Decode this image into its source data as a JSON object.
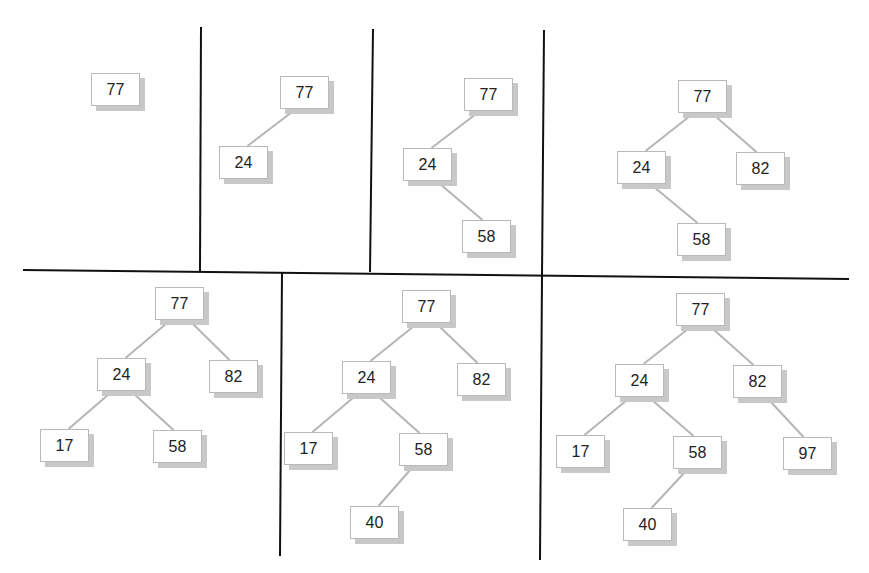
{
  "colors": {
    "divider": "#111111",
    "edge": "#b5b5b5",
    "node_border": "#b9b9b9",
    "node_shadow": "#c8c8c8",
    "text": "#222222"
  },
  "dividers": [
    {
      "x1": 201,
      "y1": 27,
      "x2": 200,
      "y2": 271
    },
    {
      "x1": 373,
      "y1": 29,
      "x2": 370,
      "y2": 272
    },
    {
      "x1": 544,
      "y1": 30,
      "x2": 542,
      "y2": 276
    },
    {
      "x1": 23,
      "y1": 270,
      "x2": 849,
      "y2": 279
    },
    {
      "x1": 282,
      "y1": 273,
      "x2": 280,
      "y2": 556
    },
    {
      "x1": 542,
      "y1": 276,
      "x2": 540,
      "y2": 560
    }
  ],
  "panels": [
    {
      "step": 1,
      "nodes": [
        {
          "id": "a",
          "value": "77",
          "x": 91,
          "y": 73
        }
      ],
      "edges": []
    },
    {
      "step": 2,
      "nodes": [
        {
          "id": "a",
          "value": "77",
          "x": 280,
          "y": 76
        },
        {
          "id": "b",
          "value": "24",
          "x": 219,
          "y": 146
        }
      ],
      "edges": [
        [
          "a",
          "b"
        ]
      ]
    },
    {
      "step": 3,
      "nodes": [
        {
          "id": "a",
          "value": "77",
          "x": 464,
          "y": 78
        },
        {
          "id": "b",
          "value": "24",
          "x": 403,
          "y": 148
        },
        {
          "id": "c",
          "value": "58",
          "x": 462,
          "y": 220
        }
      ],
      "edges": [
        [
          "a",
          "b"
        ],
        [
          "b",
          "c"
        ]
      ]
    },
    {
      "step": 4,
      "nodes": [
        {
          "id": "a",
          "value": "77",
          "x": 678,
          "y": 80
        },
        {
          "id": "b",
          "value": "24",
          "x": 617,
          "y": 151
        },
        {
          "id": "d",
          "value": "82",
          "x": 736,
          "y": 152
        },
        {
          "id": "c",
          "value": "58",
          "x": 677,
          "y": 223
        }
      ],
      "edges": [
        [
          "a",
          "b"
        ],
        [
          "a",
          "d"
        ],
        [
          "b",
          "c"
        ]
      ]
    },
    {
      "step": 5,
      "nodes": [
        {
          "id": "a",
          "value": "77",
          "x": 155,
          "y": 287
        },
        {
          "id": "b",
          "value": "24",
          "x": 97,
          "y": 358
        },
        {
          "id": "d",
          "value": "82",
          "x": 209,
          "y": 360
        },
        {
          "id": "e",
          "value": "17",
          "x": 40,
          "y": 429
        },
        {
          "id": "c",
          "value": "58",
          "x": 153,
          "y": 430
        }
      ],
      "edges": [
        [
          "a",
          "b"
        ],
        [
          "a",
          "d"
        ],
        [
          "b",
          "e"
        ],
        [
          "b",
          "c"
        ]
      ]
    },
    {
      "step": 6,
      "nodes": [
        {
          "id": "a",
          "value": "77",
          "x": 402,
          "y": 290
        },
        {
          "id": "b",
          "value": "24",
          "x": 342,
          "y": 361
        },
        {
          "id": "d",
          "value": "82",
          "x": 457,
          "y": 363
        },
        {
          "id": "e",
          "value": "17",
          "x": 284,
          "y": 432
        },
        {
          "id": "c",
          "value": "58",
          "x": 399,
          "y": 433
        },
        {
          "id": "f",
          "value": "40",
          "x": 350,
          "y": 506
        }
      ],
      "edges": [
        [
          "a",
          "b"
        ],
        [
          "a",
          "d"
        ],
        [
          "b",
          "e"
        ],
        [
          "b",
          "c"
        ],
        [
          "c",
          "f"
        ]
      ]
    },
    {
      "step": 7,
      "nodes": [
        {
          "id": "a",
          "value": "77",
          "x": 676,
          "y": 293
        },
        {
          "id": "b",
          "value": "24",
          "x": 615,
          "y": 364
        },
        {
          "id": "d",
          "value": "82",
          "x": 733,
          "y": 365
        },
        {
          "id": "e",
          "value": "17",
          "x": 556,
          "y": 435
        },
        {
          "id": "c",
          "value": "58",
          "x": 673,
          "y": 436
        },
        {
          "id": "g",
          "value": "97",
          "x": 783,
          "y": 437
        },
        {
          "id": "f",
          "value": "40",
          "x": 623,
          "y": 508
        }
      ],
      "edges": [
        [
          "a",
          "b"
        ],
        [
          "a",
          "d"
        ],
        [
          "b",
          "e"
        ],
        [
          "b",
          "c"
        ],
        [
          "c",
          "f"
        ],
        [
          "d",
          "g"
        ]
      ]
    }
  ]
}
